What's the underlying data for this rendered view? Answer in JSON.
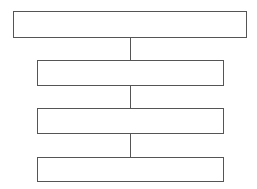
{
  "diagram": {
    "type": "vertical hierarchy / flow",
    "stroke_color": "#555555",
    "background": "#ffffff",
    "nodes": [
      {
        "id": "box-1",
        "label": ""
      },
      {
        "id": "box-2",
        "label": ""
      },
      {
        "id": "box-3",
        "label": ""
      },
      {
        "id": "box-4",
        "label": ""
      }
    ],
    "edges": [
      {
        "from": "box-1",
        "to": "box-2"
      },
      {
        "from": "box-2",
        "to": "box-3"
      },
      {
        "from": "box-3",
        "to": "box-4"
      }
    ]
  }
}
